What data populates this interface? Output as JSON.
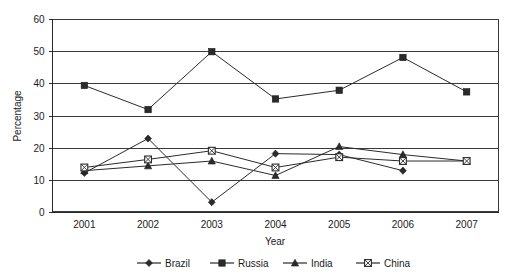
{
  "chart_data": {
    "type": "line",
    "title": "",
    "xlabel": "Year",
    "ylabel": "Percentage",
    "categories": [
      "2001",
      "2002",
      "2003",
      "2004",
      "2005",
      "2006",
      "2007"
    ],
    "ylim": [
      0,
      60
    ],
    "yticks": [
      "0",
      "10",
      "20",
      "30",
      "40",
      "50",
      "60"
    ],
    "ytick_values": [
      0,
      10,
      20,
      30,
      40,
      50,
      60
    ],
    "grid": "horizontal",
    "legend_position": "bottom",
    "series": [
      {
        "name": "Brazil",
        "marker": "diamond",
        "values": [
          12.3,
          23.0,
          3.2,
          18.3,
          18.0,
          13.0,
          null
        ]
      },
      {
        "name": "Russia",
        "marker": "square-filled",
        "values": [
          39.5,
          32.0,
          50.0,
          35.3,
          38.0,
          48.2,
          37.5
        ]
      },
      {
        "name": "India",
        "marker": "triangle",
        "values": [
          13.0,
          14.5,
          16.0,
          11.5,
          20.5,
          18.0,
          16.0
        ]
      },
      {
        "name": "China",
        "marker": "square-crossed",
        "values": [
          14.0,
          16.5,
          19.2,
          14.0,
          17.2,
          16.0,
          16.0
        ]
      }
    ]
  },
  "axes": {
    "y_label": "Percentage",
    "x_label": "Year"
  },
  "legend": {
    "entries": [
      {
        "label": "Brazil",
        "marker": "diamond"
      },
      {
        "label": "Russia",
        "marker": "square-filled"
      },
      {
        "label": "India",
        "marker": "triangle"
      },
      {
        "label": "China",
        "marker": "square-crossed"
      }
    ]
  },
  "colors": {
    "line": "#2b2b2b",
    "grid": "#3a3a3a",
    "text": "#1a1a1a",
    "background": "#ffffff"
  }
}
